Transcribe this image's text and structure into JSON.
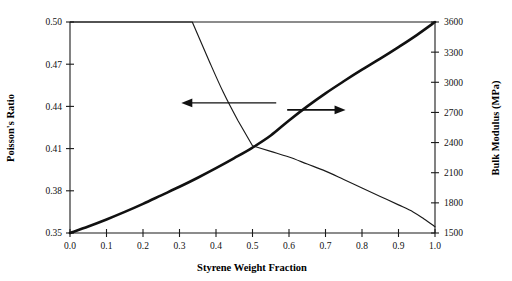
{
  "chart_data": {
    "type": "line",
    "title": "",
    "xlabel": "Styrene Weight Fraction",
    "ylabel": "Poisson's Ratio",
    "y2label": "Bulk Modulus (MPa)",
    "xlim": [
      0.0,
      1.0
    ],
    "ylim": [
      0.35,
      0.5
    ],
    "y2lim": [
      1500,
      3600
    ],
    "grid": false,
    "legend": "none",
    "xticks": [
      "0.0",
      "0.1",
      "0.2",
      "0.3",
      "0.4",
      "0.5",
      "0.6",
      "0.7",
      "0.8",
      "0.9",
      "1.0"
    ],
    "xtick_values": [
      0.0,
      0.1,
      0.2,
      0.3,
      0.4,
      0.5,
      0.6,
      0.7,
      0.8,
      0.9,
      1.0
    ],
    "yticks": [
      "0.35",
      "0.38",
      "0.41",
      "0.44",
      "0.47",
      "0.50"
    ],
    "ytick_values": [
      0.35,
      0.38,
      0.41,
      0.44,
      0.47,
      0.5
    ],
    "y2ticks": [
      "1500",
      "1800",
      "2100",
      "2400",
      "2700",
      "3000",
      "3300",
      "3600"
    ],
    "y2tick_values": [
      1500,
      1800,
      2100,
      2400,
      2700,
      3000,
      3300,
      3600
    ],
    "series": [
      {
        "name": "Poisson's Ratio",
        "axis": "left",
        "style": "thin",
        "arrow": "left",
        "x": [
          0.0,
          0.05,
          0.1,
          0.15,
          0.2,
          0.25,
          0.3,
          0.335,
          0.38,
          0.42,
          0.46,
          0.5,
          0.55,
          0.6,
          0.65,
          0.7,
          0.75,
          0.8,
          0.85,
          0.9,
          0.94,
          0.97,
          1.0
        ],
        "y": [
          0.5,
          0.5,
          0.5,
          0.5,
          0.5,
          0.5,
          0.5,
          0.5,
          0.473,
          0.45,
          0.43,
          0.412,
          0.408,
          0.404,
          0.399,
          0.394,
          0.388,
          0.382,
          0.376,
          0.37,
          0.365,
          0.36,
          0.3545
        ]
      },
      {
        "name": "Bulk Modulus",
        "axis": "right",
        "style": "thick",
        "arrow": "right",
        "x": [
          0.0,
          0.05,
          0.1,
          0.15,
          0.2,
          0.25,
          0.3,
          0.35,
          0.4,
          0.45,
          0.5,
          0.55,
          0.6,
          0.65,
          0.7,
          0.75,
          0.8,
          0.85,
          0.9,
          0.95,
          1.0
        ],
        "y": [
          1500,
          1565,
          1635,
          1710,
          1790,
          1875,
          1960,
          2050,
          2145,
          2245,
          2350,
          2470,
          2620,
          2760,
          2890,
          3010,
          3125,
          3235,
          3350,
          3470,
          3600
        ]
      }
    ],
    "annotations": [
      {
        "name": "left-arrow",
        "points_to": "left-axis",
        "x_start": 0.565,
        "x_end": 0.305,
        "y_value": 0.4425
      },
      {
        "name": "right-arrow",
        "points_to": "right-axis",
        "x_start": 0.595,
        "x_end": 0.755,
        "y_value": 0.4375
      }
    ],
    "colors": {
      "curve": "#111111",
      "axis": "#1a1a1a",
      "background": "#ffffff"
    }
  }
}
